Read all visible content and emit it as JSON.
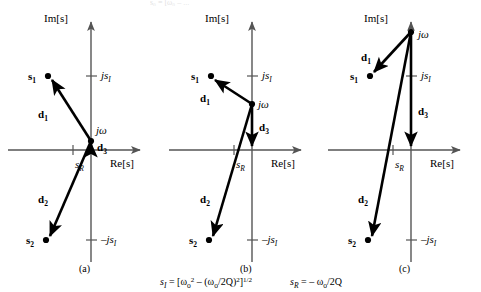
{
  "figure": {
    "type": "s-plane pole-zero vector diagram",
    "background": "#ffffff",
    "ink_color": "#000000",
    "axis_color": "#555555",
    "top_cut_text": "s₀ = [ω₀  – ...",
    "formula": {
      "si_lhs": "s",
      "si_lhs_sub": "I",
      "si_eq": " = [ω",
      "si_omega_sub": "o",
      "si_omega_sup": "2",
      "si_mid": " – (ω",
      "si_mid_sub": "o",
      "si_mid2": "/2Q)",
      "si_mid2_sup": "2",
      "si_close": "]",
      "si_close_sup": "1/2",
      "sr_lhs": "s",
      "sr_lhs_sub": "R",
      "sr_eq": " = – ω",
      "sr_omega_sub": "o",
      "sr_tail": "/2Q",
      "full_text": "s_I = [ω_o^2 – (ω_o/2Q)^2]^1/2    s_R = – ω_o/2Q"
    },
    "axis_titles": {
      "imaginary": "Im[s]",
      "real": "Re[s]"
    },
    "tick_labels": {
      "js_positive": "js",
      "js_positive_sub": "I",
      "js_negative": "–js",
      "js_negative_sub": "I",
      "sr": "s",
      "sr_sub": "R"
    },
    "point_labels": {
      "s1": "s",
      "s1_sub": "1",
      "s2": "s",
      "s2_sub": "2",
      "jomega": "jω"
    },
    "vector_labels": {
      "d1": "d",
      "d1_sub": "1",
      "d2": "d",
      "d2_sub": "2",
      "d3": "d",
      "d3_sub": "3"
    },
    "panels": [
      {
        "id": "a",
        "caption": "(a)",
        "description": "Test frequency jω located near the origin (low frequency). Vector d3 is very short.",
        "origin": {
          "x": 91,
          "y": 150
        },
        "jomega": {
          "x": 91,
          "y": 141
        },
        "s1": {
          "x": 48,
          "y": 76
        },
        "s2": {
          "x": 46,
          "y": 240
        },
        "sr_tick_x": 73,
        "js_pos_y": 76,
        "js_neg_y": 240,
        "vectors": [
          {
            "name": "d1",
            "from": "jomega",
            "to": "s1",
            "label_x": 44,
            "label_y": 115
          },
          {
            "name": "d2",
            "from": "jomega",
            "to": "s2",
            "label_x": 44,
            "label_y": 200
          },
          {
            "name": "d3",
            "from": "origin",
            "to": "jomega",
            "label_x": 101,
            "label_y": 150
          }
        ]
      },
      {
        "id": "b",
        "caption": "(b)",
        "description": "Test frequency jω at resonance, level with pole s1. Vector d3 has moderate length.",
        "origin": {
          "x": 252,
          "y": 150
        },
        "jomega": {
          "x": 252,
          "y": 104
        },
        "s1": {
          "x": 211,
          "y": 76
        },
        "s2": {
          "x": 209,
          "y": 240
        },
        "sr_tick_x": 234,
        "js_pos_y": 76,
        "js_neg_y": 240,
        "vectors": [
          {
            "name": "d1",
            "from": "jomega",
            "to": "s1",
            "label_x": 206,
            "label_y": 99
          },
          {
            "name": "d2",
            "from": "jomega",
            "to": "s2",
            "label_x": 206,
            "label_y": 200
          },
          {
            "name": "d3",
            "from": "jomega",
            "to": "origin",
            "label_x": 262,
            "label_y": 128
          }
        ]
      },
      {
        "id": "c",
        "caption": "(c)",
        "description": "Test frequency jω high above the poles (high frequency). Vector d3 is long.",
        "origin": {
          "x": 411,
          "y": 150
        },
        "jomega": {
          "x": 411,
          "y": 32
        },
        "s1": {
          "x": 370,
          "y": 76
        },
        "s2": {
          "x": 368,
          "y": 240
        },
        "sr_tick_x": 393,
        "js_pos_y": 76,
        "js_neg_y": 240,
        "vectors": [
          {
            "name": "d1",
            "from": "jomega",
            "to": "s1",
            "label_x": 367,
            "label_y": 58
          },
          {
            "name": "d2",
            "from": "jomega",
            "to": "s2",
            "label_x": 364,
            "label_y": 200
          },
          {
            "name": "d3",
            "from": "jomega",
            "to": "origin",
            "label_x": 421,
            "label_y": 112
          }
        ]
      }
    ]
  }
}
